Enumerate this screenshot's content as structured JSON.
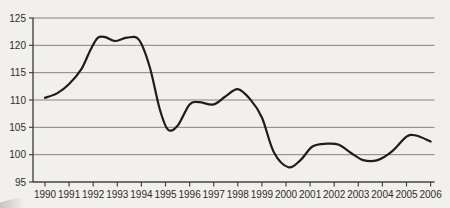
{
  "page": {
    "background": "#f1f0ec"
  },
  "chart_data": {
    "type": "line",
    "title": "",
    "xlabel": "",
    "ylabel": "",
    "legend": "none",
    "grid": "horizontal",
    "ylim": [
      95,
      125
    ],
    "y_tick_step": 5,
    "y_tick_labels": [
      "95",
      "100",
      "105",
      "110",
      "115",
      "120",
      "125"
    ],
    "y_tick_values": [
      95,
      100,
      105,
      110,
      115,
      120,
      125
    ],
    "x_tick_labels": [
      "1990",
      "1991",
      "1992",
      "1993",
      "1994",
      "1995",
      "1996",
      "1997",
      "1998",
      "1999",
      "2000",
      "2001",
      "2002",
      "2003",
      "2004",
      "2005",
      "2006"
    ],
    "categories": [
      1990,
      1991,
      1992,
      1993,
      1994,
      1995,
      1996,
      1997,
      1998,
      1999,
      2000,
      2001,
      2002,
      2003,
      2004,
      2005,
      2006
    ],
    "series": [
      {
        "name": "index-line",
        "values": [
          110.4,
          112.9,
          121.3,
          121.2,
          120.6,
          104.7,
          109.2,
          109.2,
          112.0,
          106.8,
          97.7,
          101.4,
          101.9,
          99.4,
          99.4,
          103.4,
          102.4
        ],
        "curve_points": [
          [
            1990.0,
            110.4
          ],
          [
            1990.5,
            111.2
          ],
          [
            1991.0,
            112.9
          ],
          [
            1991.5,
            115.6
          ],
          [
            1991.9,
            119.3
          ],
          [
            1992.2,
            121.4
          ],
          [
            1992.5,
            121.5
          ],
          [
            1992.9,
            120.8
          ],
          [
            1993.4,
            121.4
          ],
          [
            1993.9,
            121.0
          ],
          [
            1994.35,
            116.0
          ],
          [
            1994.75,
            108.5
          ],
          [
            1995.1,
            104.6
          ],
          [
            1995.5,
            105.3
          ],
          [
            1996.0,
            109.2
          ],
          [
            1996.4,
            109.6
          ],
          [
            1997.0,
            109.2
          ],
          [
            1997.5,
            110.7
          ],
          [
            1998.0,
            112.0
          ],
          [
            1998.5,
            110.2
          ],
          [
            1999.0,
            106.8
          ],
          [
            1999.5,
            100.4
          ],
          [
            2000.1,
            97.7
          ],
          [
            2000.6,
            99.0
          ],
          [
            2001.1,
            101.5
          ],
          [
            2001.7,
            102.0
          ],
          [
            2002.2,
            101.8
          ],
          [
            2002.7,
            100.3
          ],
          [
            2003.2,
            99.0
          ],
          [
            2003.8,
            99.0
          ],
          [
            2004.4,
            100.6
          ],
          [
            2005.0,
            103.3
          ],
          [
            2005.4,
            103.5
          ],
          [
            2006.0,
            102.4
          ]
        ]
      }
    ],
    "colors": {
      "line": "#1d1d1d",
      "grid": "#848484",
      "axis": "#454545",
      "text": "#2d2d2d"
    }
  }
}
